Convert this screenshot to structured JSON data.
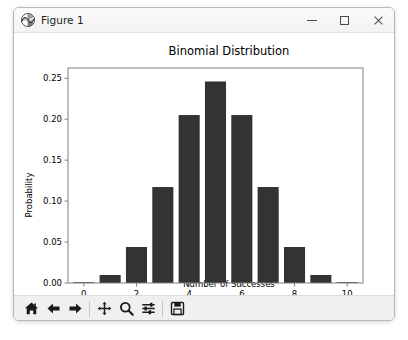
{
  "window": {
    "title": "Figure 1",
    "app_icon": "matplotlib-icon",
    "controls": {
      "minimize_label": "Minimize",
      "maximize_label": "Maximize",
      "close_label": "Close"
    }
  },
  "toolbar": {
    "buttons": [
      {
        "name": "home-icon",
        "label": "Reset original view"
      },
      {
        "name": "back-arrow-icon",
        "label": "Back to previous view"
      },
      {
        "name": "forward-arrow-icon",
        "label": "Forward to next view"
      },
      {
        "name": "pan-move-icon",
        "label": "Pan axes with left mouse, zoom with right"
      },
      {
        "name": "zoom-magnifier-icon",
        "label": "Zoom to rectangle"
      },
      {
        "name": "configure-subplots-icon",
        "label": "Configure subplots"
      },
      {
        "name": "save-floppy-icon",
        "label": "Save the figure"
      }
    ]
  },
  "chart_data": {
    "type": "bar",
    "title": "Binomial Distribution",
    "xlabel": "Number of Successes",
    "ylabel": "Probability",
    "categories": [
      0,
      1,
      2,
      3,
      4,
      5,
      6,
      7,
      8,
      9,
      10
    ],
    "values": [
      0.000977,
      0.009766,
      0.043945,
      0.117188,
      0.205078,
      0.246094,
      0.205078,
      0.117188,
      0.043945,
      0.009766,
      0.000977
    ],
    "xlim": [
      -0.6,
      10.6
    ],
    "ylim": [
      0.0,
      0.2625
    ],
    "xticks": [
      0,
      2,
      4,
      6,
      8,
      10
    ],
    "xticklabels": [
      "0",
      "2",
      "4",
      "6",
      "8",
      "10"
    ],
    "yticks": [
      0.0,
      0.05,
      0.1,
      0.15,
      0.2,
      0.25
    ],
    "yticklabels": [
      "0.00",
      "0.05",
      "0.10",
      "0.15",
      "0.20",
      "0.25"
    ],
    "grid": false,
    "legend": null,
    "bar_color": "#333333",
    "bar_width": 0.8,
    "axes_color": "#808080",
    "text_color": "#000000"
  }
}
